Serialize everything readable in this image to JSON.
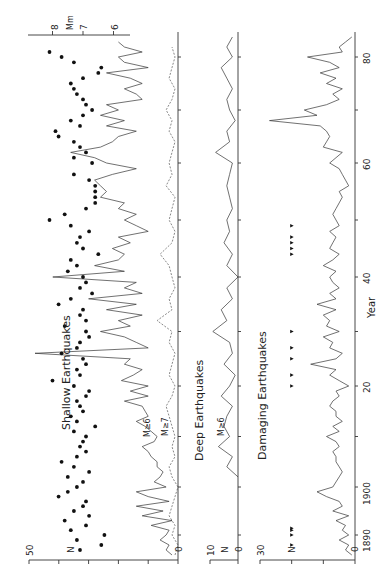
{
  "chart_data": [
    {
      "type": "line",
      "title": "Shallow Earthquakes",
      "xlabel": "Year",
      "ylabel": "N",
      "xlim": [
        1885,
        1985
      ],
      "ylim": [
        0,
        50
      ],
      "yticks": [
        0,
        10,
        20,
        30,
        40,
        50
      ],
      "ytick_labels": [
        "0",
        "",
        "",
        "",
        "",
        "50"
      ],
      "secondary_axis": {
        "label": "Mm",
        "ticks": [
          8,
          7,
          6
        ],
        "range": [
          5.3,
          8.3
        ]
      },
      "annotations": [
        "M≥6",
        "M≥7"
      ],
      "series": [
        {
          "name": "M≥6",
          "style": "solid",
          "x": [
            1886,
            1887,
            1888,
            1889,
            1890,
            1891,
            1892,
            1893,
            1894,
            1895,
            1896,
            1897,
            1898,
            1899,
            1900,
            1901,
            1902,
            1903,
            1904,
            1905,
            1906,
            1907,
            1908,
            1909,
            1910,
            1911,
            1912,
            1913,
            1914,
            1915,
            1916,
            1917,
            1918,
            1919,
            1920,
            1921,
            1922,
            1923,
            1924,
            1925,
            1926,
            1927,
            1928,
            1929,
            1930,
            1931,
            1932,
            1933,
            1934,
            1935,
            1936,
            1937,
            1938,
            1939,
            1940,
            1941,
            1942,
            1943,
            1944,
            1945,
            1946,
            1947,
            1948,
            1949,
            1950,
            1951,
            1952,
            1953,
            1954,
            1955,
            1956,
            1957,
            1958,
            1959,
            1960,
            1961,
            1962,
            1963,
            1964,
            1965,
            1966,
            1967,
            1968,
            1969,
            1970,
            1971,
            1972,
            1973,
            1974,
            1975,
            1976,
            1977,
            1978,
            1979,
            1980,
            1981,
            1982,
            1983
          ],
          "values": [
            2,
            4,
            3,
            6,
            4,
            3,
            9,
            2,
            12,
            5,
            14,
            3,
            10,
            14,
            4,
            8,
            6,
            5,
            7,
            7,
            9,
            10,
            12,
            8,
            7,
            9,
            11,
            14,
            10,
            11,
            12,
            18,
            10,
            16,
            10,
            19,
            15,
            12,
            18,
            16,
            48,
            10,
            14,
            18,
            26,
            16,
            20,
            12,
            24,
            14,
            30,
            12,
            18,
            14,
            42,
            18,
            28,
            20,
            18,
            22,
            16,
            20,
            10,
            14,
            18,
            14,
            20,
            18,
            26,
            24,
            26,
            28,
            22,
            14,
            24,
            28,
            36,
            26,
            22,
            20,
            14,
            24,
            18,
            26,
            20,
            24,
            12,
            14,
            18,
            12,
            16,
            24,
            10,
            18,
            20,
            12,
            18,
            20
          ]
        },
        {
          "name": "M≥7",
          "style": "dashed",
          "x": [
            1886,
            1888,
            1890,
            1892,
            1894,
            1896,
            1898,
            1900,
            1902,
            1904,
            1906,
            1908,
            1910,
            1912,
            1914,
            1916,
            1918,
            1920,
            1922,
            1924,
            1926,
            1928,
            1930,
            1932,
            1934,
            1936,
            1938,
            1940,
            1942,
            1944,
            1946,
            1948,
            1950,
            1952,
            1954,
            1956,
            1958,
            1960,
            1962,
            1964,
            1966,
            1968,
            1970,
            1972,
            1974,
            1976,
            1978,
            1980,
            1982
          ],
          "values": [
            1,
            0,
            2,
            1,
            3,
            2,
            1,
            0,
            2,
            3,
            1,
            2,
            1,
            2,
            3,
            4,
            2,
            1,
            3,
            2,
            1,
            3,
            2,
            7,
            2,
            3,
            1,
            2,
            3,
            6,
            2,
            1,
            3,
            2,
            1,
            4,
            2,
            3,
            2,
            1,
            3,
            2,
            4,
            2,
            1,
            3,
            2,
            1,
            2
          ]
        },
        {
          "name": "Mm (individual events, right axis)",
          "style": "points",
          "x": [
            1887,
            1888,
            1889,
            1890,
            1891,
            1892,
            1893,
            1894,
            1895,
            1896,
            1897,
            1898,
            1899,
            1900,
            1901,
            1902,
            1903,
            1904,
            1905,
            1906,
            1907,
            1908,
            1909,
            1910,
            1911,
            1912,
            1913,
            1914,
            1915,
            1916,
            1917,
            1918,
            1919,
            1920,
            1921,
            1922,
            1923,
            1924,
            1925,
            1926,
            1927,
            1928,
            1929,
            1930,
            1931,
            1932,
            1933,
            1934,
            1935,
            1936,
            1937,
            1938,
            1939,
            1940,
            1941,
            1942,
            1943,
            1944,
            1945,
            1946,
            1947,
            1948,
            1949,
            1950,
            1951,
            1952,
            1953,
            1954,
            1955,
            1956,
            1957,
            1958,
            1960,
            1961,
            1962,
            1963,
            1964,
            1965,
            1966,
            1967,
            1968,
            1969,
            1970,
            1971,
            1972,
            1973,
            1974,
            1975,
            1976,
            1977,
            1978,
            1979,
            1980,
            1981
          ],
          "values": [
            7.1,
            6.4,
            7.2,
            6.3,
            7.4,
            6.9,
            7.6,
            6.8,
            7.3,
            7.0,
            6.9,
            7.8,
            7.5,
            7.2,
            7.0,
            7.5,
            6.8,
            7.3,
            7.7,
            7.2,
            6.9,
            7.1,
            7.0,
            6.9,
            7.3,
            6.6,
            7.2,
            7.4,
            7.0,
            7.1,
            7.2,
            6.9,
            6.8,
            7.3,
            8.0,
            7.1,
            7.2,
            6.9,
            7.0,
            7.7,
            7.2,
            7.1,
            6.8,
            6.9,
            7.6,
            6.9,
            7.1,
            7.0,
            7.8,
            7.4,
            6.7,
            7.1,
            6.9,
            7.0,
            7.5,
            7.2,
            7.4,
            6.5,
            7.0,
            7.2,
            7.1,
            6.8,
            7.4,
            8.1,
            7.6,
            6.9,
            6.6,
            6.6,
            6.6,
            6.6,
            6.8,
            7.3,
            6.7,
            7.3,
            6.9,
            7.1,
            7.3,
            7.8,
            7.9,
            7.1,
            7.4,
            7.0,
            6.7,
            6.9,
            7.0,
            7.2,
            7.3,
            7.4,
            7.0,
            6.5,
            6.4,
            7.3,
            7.7,
            8.1
          ]
        }
      ]
    },
    {
      "type": "line",
      "title": "Deep Earthquakes",
      "annotations": [
        "M≥6"
      ],
      "xlabel": "Year",
      "ylabel": "N",
      "xlim": [
        1885,
        1985
      ],
      "ylim": [
        0,
        10
      ],
      "yticks": [
        0,
        10
      ],
      "ytick_labels": [
        "0",
        "10"
      ],
      "series": [
        {
          "name": "M≥6",
          "style": "solid",
          "x": [
            1902,
            1904,
            1906,
            1908,
            1910,
            1912,
            1914,
            1916,
            1918,
            1920,
            1922,
            1924,
            1926,
            1928,
            1930,
            1932,
            1934,
            1936,
            1938,
            1940,
            1942,
            1944,
            1946,
            1948,
            1950,
            1952,
            1954,
            1956,
            1958,
            1960,
            1962,
            1964,
            1966,
            1968,
            1970,
            1972,
            1974,
            1976,
            1978,
            1980,
            1982,
            1984
          ],
          "values": [
            0,
            4,
            2,
            7,
            3,
            5,
            4,
            2,
            6,
            3,
            1,
            5,
            2,
            3,
            9,
            4,
            6,
            2,
            4,
            0,
            4,
            2,
            5,
            3,
            4,
            2,
            3,
            4,
            3,
            2,
            8,
            3,
            4,
            1,
            3,
            4,
            2,
            4,
            6,
            2,
            4,
            2
          ]
        }
      ]
    },
    {
      "type": "line",
      "title": "Damaging Earthquakes",
      "xlabel": "Year",
      "ylabel": "N",
      "xlim": [
        1885,
        1985
      ],
      "ylim": [
        0,
        30
      ],
      "yticks": [
        0,
        10,
        20,
        30
      ],
      "ytick_labels": [
        "0",
        "",
        "",
        "30"
      ],
      "series": [
        {
          "name": "Damaging",
          "style": "solid",
          "x": [
            1886,
            1887,
            1888,
            1889,
            1890,
            1891,
            1892,
            1893,
            1894,
            1895,
            1896,
            1897,
            1898,
            1899,
            1900,
            1901,
            1902,
            1903,
            1904,
            1905,
            1906,
            1907,
            1908,
            1909,
            1910,
            1911,
            1912,
            1913,
            1914,
            1915,
            1916,
            1917,
            1918,
            1919,
            1920,
            1921,
            1922,
            1923,
            1924,
            1925,
            1926,
            1927,
            1928,
            1929,
            1930,
            1931,
            1932,
            1933,
            1934,
            1935,
            1936,
            1937,
            1938,
            1939,
            1940,
            1941,
            1942,
            1943,
            1944,
            1945,
            1946,
            1947,
            1948,
            1949,
            1950,
            1951,
            1952,
            1953,
            1954,
            1955,
            1956,
            1957,
            1958,
            1959,
            1960,
            1961,
            1962,
            1963,
            1964,
            1965,
            1966,
            1967,
            1968,
            1969,
            1970,
            1971,
            1972,
            1973,
            1974,
            1975,
            1976,
            1977,
            1978,
            1979,
            1980,
            1981,
            1982,
            1983,
            1984
          ],
          "values": [
            1,
            3,
            2,
            5,
            2,
            4,
            3,
            6,
            2,
            7,
            4,
            5,
            9,
            12,
            7,
            6,
            5,
            4,
            5,
            6,
            6,
            7,
            5,
            6,
            9,
            5,
            7,
            4,
            6,
            6,
            8,
            7,
            5,
            6,
            2,
            5,
            8,
            6,
            14,
            6,
            4,
            8,
            7,
            10,
            5,
            9,
            8,
            10,
            6,
            12,
            6,
            8,
            5,
            7,
            8,
            6,
            10,
            7,
            5,
            8,
            7,
            6,
            8,
            5,
            6,
            7,
            6,
            5,
            4,
            5,
            2,
            3,
            4,
            5,
            8,
            6,
            4,
            10,
            9,
            8,
            9,
            11,
            27,
            12,
            16,
            9,
            5,
            7,
            4,
            9,
            6,
            11,
            5,
            8,
            15,
            4,
            5,
            3,
            1
          ]
        },
        {
          "name": "Damaging (markers, N≈20)",
          "style": "triangles",
          "x": [
            1888,
            1890,
            1891,
            1891.4,
            1920,
            1922,
            1925,
            1927,
            1930,
            1944,
            1945,
            1946,
            1947,
            1949
          ],
          "values": [
            20,
            20,
            20,
            20,
            20,
            20,
            20,
            20,
            20,
            20,
            20,
            20,
            20,
            20
          ]
        }
      ]
    }
  ],
  "labels": {
    "shallow_title": "Shallow Earthquakes",
    "deep_title": "Deep Earthquakes",
    "damaging_title": "Damaging Earthquakes",
    "m6": "M≥6",
    "m7": "M≥7",
    "deep_m6": "M≥6",
    "n": "N",
    "year": "Year",
    "mm": "Mm",
    "year_ticks": [
      "1890",
      "1900",
      "20",
      "40",
      "60",
      "80"
    ],
    "shallow_y50": "50",
    "shallow_y0": "0",
    "deep_y10": "10",
    "deep_y0": "0",
    "dmg_y30": "30",
    "dmg_y0": "0",
    "mm_8": "8",
    "mm_7": "7",
    "mm_6": "6"
  }
}
